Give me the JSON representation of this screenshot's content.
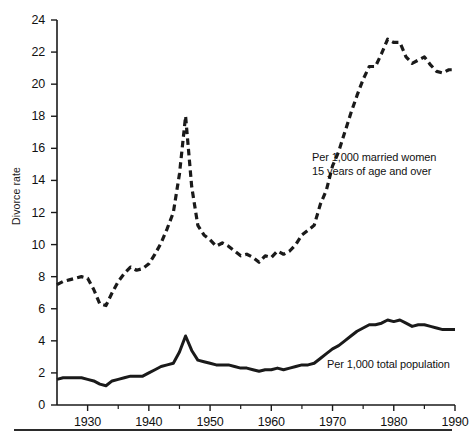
{
  "chart_data": {
    "type": "line",
    "title": "",
    "xlabel": "",
    "ylabel": "Divorce rate",
    "xlim": [
      1925,
      1990
    ],
    "ylim": [
      0,
      24
    ],
    "grid": false,
    "legend_position": "inline-annotations",
    "yticks": [
      0,
      2,
      4,
      6,
      8,
      10,
      12,
      14,
      16,
      18,
      20,
      22,
      24
    ],
    "ytick_labels": [
      "0",
      "2",
      "4",
      "6",
      "8",
      "10",
      "12",
      "14",
      "16",
      "18",
      "20",
      "22",
      "24"
    ],
    "xticks": [
      1930,
      1940,
      1950,
      1960,
      1970,
      1980,
      1990
    ],
    "xtick_labels": [
      "1930",
      "1940",
      "1950",
      "1960",
      "1970",
      "1980",
      "1990"
    ],
    "annotations": [
      {
        "name": "married-women-label",
        "text_line1": "Per 1,000 married women",
        "text_line2": "15 years of age and over"
      },
      {
        "name": "total-population-label",
        "text_line1": "Per 1,000 total population",
        "text_line2": ""
      }
    ],
    "series": [
      {
        "name": "Per 1,000 married women 15 years of age and over",
        "style": "dashed",
        "color": "#1a1a1a",
        "x": [
          1925,
          1926,
          1927,
          1928,
          1929,
          1930,
          1931,
          1932,
          1933,
          1934,
          1935,
          1936,
          1937,
          1938,
          1939,
          1940,
          1941,
          1942,
          1943,
          1944,
          1945,
          1946,
          1947,
          1948,
          1949,
          1950,
          1951,
          1952,
          1953,
          1954,
          1955,
          1956,
          1957,
          1958,
          1959,
          1960,
          1961,
          1962,
          1963,
          1964,
          1965,
          1966,
          1967,
          1968,
          1969,
          1970,
          1971,
          1972,
          1973,
          1974,
          1975,
          1976,
          1977,
          1978,
          1979,
          1980,
          1981,
          1982,
          1983,
          1984,
          1985,
          1986,
          1987,
          1988,
          1989,
          1990
        ],
        "y": [
          7.5,
          7.7,
          7.8,
          7.9,
          8.0,
          7.9,
          7.2,
          6.3,
          6.2,
          7.0,
          7.7,
          8.2,
          8.6,
          8.4,
          8.5,
          8.8,
          9.4,
          10.1,
          11.0,
          12.0,
          14.4,
          18.0,
          13.6,
          11.2,
          10.6,
          10.3,
          9.9,
          10.1,
          9.9,
          9.6,
          9.3,
          9.4,
          9.2,
          8.9,
          9.3,
          9.2,
          9.6,
          9.4,
          9.6,
          10.0,
          10.6,
          10.9,
          11.2,
          12.5,
          13.4,
          14.9,
          15.8,
          17.0,
          18.2,
          19.3,
          20.3,
          21.1,
          21.1,
          21.9,
          22.8,
          22.6,
          22.6,
          21.7,
          21.3,
          21.5,
          21.7,
          21.2,
          20.8,
          20.7,
          20.9,
          20.9
        ]
      },
      {
        "name": "Per 1,000 total population",
        "style": "solid",
        "color": "#1a1a1a",
        "x": [
          1925,
          1926,
          1927,
          1928,
          1929,
          1930,
          1931,
          1932,
          1933,
          1934,
          1935,
          1936,
          1937,
          1938,
          1939,
          1940,
          1941,
          1942,
          1943,
          1944,
          1945,
          1946,
          1947,
          1948,
          1949,
          1950,
          1951,
          1952,
          1953,
          1954,
          1955,
          1956,
          1957,
          1958,
          1959,
          1960,
          1961,
          1962,
          1963,
          1964,
          1965,
          1966,
          1967,
          1968,
          1969,
          1970,
          1971,
          1972,
          1973,
          1974,
          1975,
          1976,
          1977,
          1978,
          1979,
          1980,
          1981,
          1982,
          1983,
          1984,
          1985,
          1986,
          1987,
          1988,
          1989,
          1990
        ],
        "y": [
          1.6,
          1.7,
          1.7,
          1.7,
          1.7,
          1.6,
          1.5,
          1.3,
          1.2,
          1.5,
          1.6,
          1.7,
          1.8,
          1.8,
          1.8,
          2.0,
          2.2,
          2.4,
          2.5,
          2.6,
          3.3,
          4.3,
          3.4,
          2.8,
          2.7,
          2.6,
          2.5,
          2.5,
          2.5,
          2.4,
          2.3,
          2.3,
          2.2,
          2.1,
          2.2,
          2.2,
          2.3,
          2.2,
          2.3,
          2.4,
          2.5,
          2.5,
          2.6,
          2.9,
          3.2,
          3.5,
          3.7,
          4.0,
          4.3,
          4.6,
          4.8,
          5.0,
          5.0,
          5.1,
          5.3,
          5.2,
          5.3,
          5.1,
          4.9,
          5.0,
          5.0,
          4.9,
          4.8,
          4.7,
          4.7,
          4.7
        ]
      }
    ]
  }
}
